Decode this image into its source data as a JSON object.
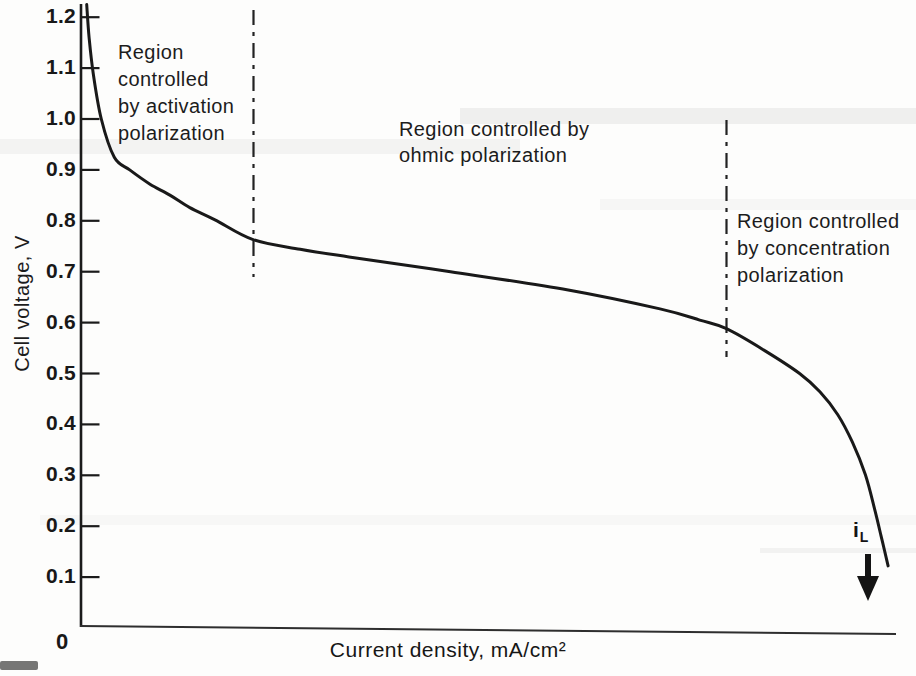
{
  "figure": {
    "y_axis": {
      "label": "Cell voltage, V",
      "ticks": [
        "1.2",
        "1.1",
        "1.0",
        "0.9",
        "0.8",
        "0.7",
        "0.6",
        "0.5",
        "0.4",
        "0.3",
        "0.2",
        "0.1"
      ],
      "origin_label": "0"
    },
    "x_axis": {
      "label": "Current density, mA/cm²"
    },
    "regions": [
      {
        "label": "Region\ncontrolled\nby activation\npolarization"
      },
      {
        "label": "Region controlled by\nohmic polarization"
      },
      {
        "label": "Region controlled\nby concentration\npolarization"
      }
    ],
    "limiting_current": {
      "base": "i",
      "sub": "L"
    }
  },
  "chart_data": {
    "type": "line",
    "title": "",
    "xlabel": "Current density, mA/cm²",
    "ylabel": "Cell voltage, V",
    "ylim": [
      0,
      1.2
    ],
    "x_tick_labels": [
      "0"
    ],
    "x_units_note": "x axis has no numeric scale; x given as fraction of axis length",
    "grid": false,
    "legend": "none",
    "series": [
      {
        "name": "cell voltage vs current density",
        "points": [
          [
            0.007,
            1.225
          ],
          [
            0.01,
            1.16
          ],
          [
            0.015,
            1.09
          ],
          [
            0.025,
            1.0
          ],
          [
            0.041,
            0.925
          ],
          [
            0.06,
            0.9
          ],
          [
            0.085,
            0.872
          ],
          [
            0.11,
            0.85
          ],
          [
            0.134,
            0.826
          ],
          [
            0.165,
            0.802
          ],
          [
            0.212,
            0.763
          ],
          [
            0.27,
            0.744
          ],
          [
            0.33,
            0.729
          ],
          [
            0.455,
            0.7
          ],
          [
            0.6,
            0.664
          ],
          [
            0.713,
            0.627
          ],
          [
            0.762,
            0.605
          ],
          [
            0.795,
            0.588
          ],
          [
            0.842,
            0.545
          ],
          [
            0.885,
            0.5
          ],
          [
            0.91,
            0.464
          ],
          [
            0.932,
            0.419
          ],
          [
            0.95,
            0.365
          ],
          [
            0.966,
            0.301
          ],
          [
            0.977,
            0.236
          ],
          [
            0.985,
            0.183
          ],
          [
            0.99,
            0.149
          ],
          [
            0.994,
            0.122
          ]
        ]
      }
    ],
    "region_boundaries_x_fraction": [
      0.212,
      0.795
    ],
    "annotations": [
      {
        "label": "Region controlled by activation polarization",
        "x_range": [
          0.0,
          0.212
        ]
      },
      {
        "label": "Region controlled by ohmic polarization",
        "x_range": [
          0.212,
          0.795
        ]
      },
      {
        "label": "Region controlled by concentration polarization",
        "x_range": [
          0.795,
          1.0
        ]
      },
      {
        "label": "i_L",
        "meaning": "limiting current density marker with downward arrow",
        "x_fraction": 0.968,
        "y_value": 0.15
      }
    ]
  }
}
